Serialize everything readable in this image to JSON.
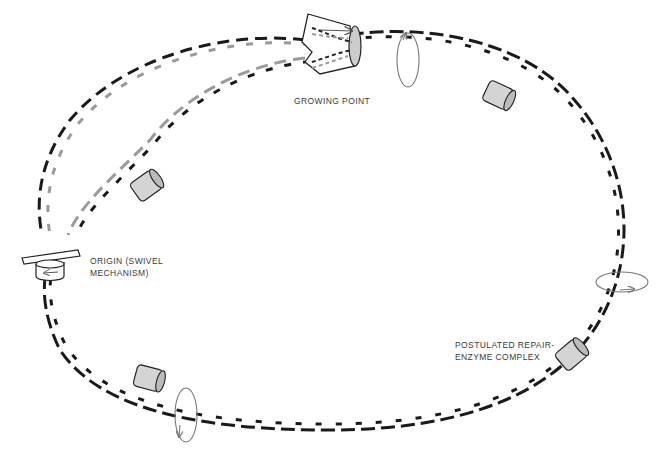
{
  "labels": {
    "growing_point": "GROWING POINT",
    "origin_line1": "ORIGIN (SWIVEL",
    "origin_line2": "MECHANISM)",
    "repair_line1": "POSTULATED REPAIR-",
    "repair_line2": "ENZYME COMPLEX"
  },
  "colors": {
    "parental_strand": "#1a1a1a",
    "daughter_strand": "#9a9a9a",
    "enzyme_fill": "#d4d4d4",
    "rotation_arrow": "#777777"
  },
  "elements": {
    "enzyme_complexes": 4,
    "rotation_indicators": 3,
    "direction_arrow": "right"
  }
}
